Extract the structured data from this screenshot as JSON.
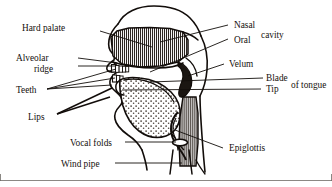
{
  "diagram": {
    "type": "anatomical-cross-section",
    "orientation": "facing-left",
    "line_color": "#120d0a",
    "background_color": "#ffffff",
    "frame_color": "#6d6964",
    "labels": {
      "hard_palate": "Hard palate",
      "alveolar_line1": "Alveolar",
      "alveolar_line2": "ridge",
      "teeth": "Teeth",
      "lips": "Lips",
      "vocal_folds": "Vocal folds",
      "wind_pipe": "Wind pipe",
      "nasal": "Nasal",
      "oral": "Oral",
      "cavity": "cavity",
      "velum": "Velum",
      "blade": "Blade",
      "tip": "Tip",
      "of_tongue": "of tongue",
      "epiglottis": "Epiglottis"
    },
    "structures": [
      "hard-palate",
      "alveolar-ridge",
      "teeth",
      "lips",
      "nasal-cavity",
      "oral-cavity",
      "velum",
      "tongue-blade",
      "tongue-tip",
      "tongue-body",
      "epiglottis",
      "vocal-folds",
      "wind-pipe",
      "pharynx"
    ],
    "fills": {
      "hatched_tissue": "vertical-line-hatch",
      "tongue": "stipple-dots",
      "teeth": "white"
    }
  }
}
